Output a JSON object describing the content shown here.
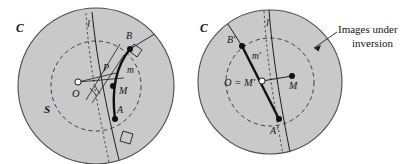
{
  "figure": {
    "background_color": "#ffffff",
    "disk_fill_color": "#c9c9c9",
    "disk_stroke_color": "#4a4a4a",
    "ink_color": "#141414",
    "dashed_circle_color": "#3a3a3a"
  },
  "left_panel": {
    "name": "original-configuration",
    "labels": {
      "outer_circle": "C",
      "region": "S",
      "line_l": "l",
      "center": "O",
      "point_P": "P",
      "point_B": "B",
      "point_A": "A",
      "point_M": "M",
      "arc_m": "m"
    }
  },
  "right_panel": {
    "name": "inverted-configuration",
    "labels": {
      "outer_circle": "C",
      "line_l": "l",
      "center": "O = M'",
      "point_B": "B'",
      "point_A": "A'",
      "point_M": "M",
      "segment_m": "m'"
    }
  },
  "annotation": {
    "name": "images-under-inversion-callout",
    "line1": "Images under",
    "line2": "inversion"
  }
}
